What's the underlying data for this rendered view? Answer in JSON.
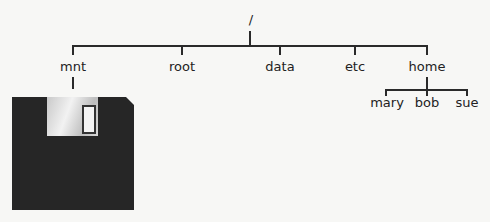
{
  "diagram": {
    "type": "filesystem-tree",
    "root": {
      "label": "/"
    },
    "level1": [
      {
        "label": "mnt"
      },
      {
        "label": "root"
      },
      {
        "label": "data"
      },
      {
        "label": "etc"
      },
      {
        "label": "home"
      }
    ],
    "home_children": [
      {
        "label": "mary"
      },
      {
        "label": "bob"
      },
      {
        "label": "sue"
      }
    ],
    "mnt_attachment": {
      "icon": "floppy-disk-icon"
    }
  }
}
